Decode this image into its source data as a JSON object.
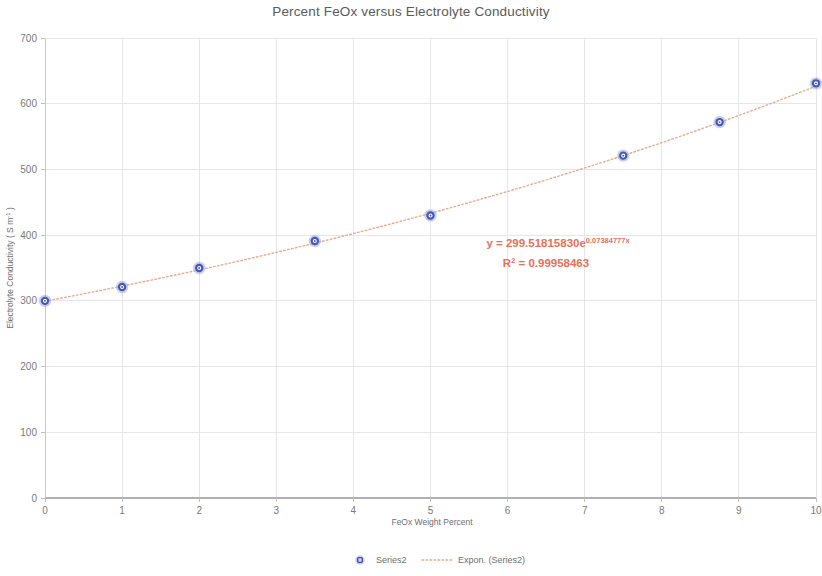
{
  "chart_data": {
    "type": "scatter",
    "title": "Percent FeOx versus Electrolyte Conductivity",
    "xlabel": "FeOx Weight Percent",
    "ylabel": "Electrolyte Conductivity ( S m",
    "ylabel_sup": "-1",
    "ylabel_tail": " )",
    "xlim": [
      0,
      10
    ],
    "ylim": [
      0,
      700
    ],
    "x_ticks": [
      "0",
      "1",
      "2",
      "3",
      "4",
      "5",
      "6",
      "7",
      "8",
      "9",
      "10"
    ],
    "x_tick_values": [
      0,
      1,
      2,
      3,
      4,
      5,
      6,
      7,
      8,
      9,
      10
    ],
    "y_ticks": [
      "0",
      "100",
      "200",
      "300",
      "400",
      "500",
      "600",
      "700"
    ],
    "y_tick_values": [
      0,
      100,
      200,
      300,
      400,
      500,
      600,
      700
    ],
    "grid": true,
    "legend_position": "bottom",
    "series": [
      {
        "name": "Series2",
        "type": "scatter",
        "marker_color": "#4557b5",
        "x": [
          0,
          1,
          2,
          3.5,
          5,
          7.5,
          8.75,
          10
        ],
        "values": [
          300,
          321,
          350,
          391,
          430,
          521,
          572,
          631
        ]
      },
      {
        "name": "Expon. (Series2)",
        "type": "trendline",
        "line_color": "#e9a98e",
        "style": "dotted",
        "fit": "exponential",
        "coefficient": 299.5181583,
        "exponent_rate": 0.07384777,
        "r_squared": 0.99958463
      }
    ],
    "annotations": [
      {
        "name": "trendline-equation",
        "line1_prefix": "y = 299.51815830e",
        "line1_superscript": "0.07384777x",
        "line2_prefix": "R",
        "line2_superscript": "2",
        "line2_suffix": " = 0.99958463",
        "color": "#e8705a"
      }
    ],
    "legend": [
      {
        "label": "Series2",
        "marker": "circle-marker",
        "color": "#4557b5"
      },
      {
        "label": "Expon. (Series2)",
        "marker": "dotted-line",
        "color": "#e9a98e"
      }
    ]
  }
}
